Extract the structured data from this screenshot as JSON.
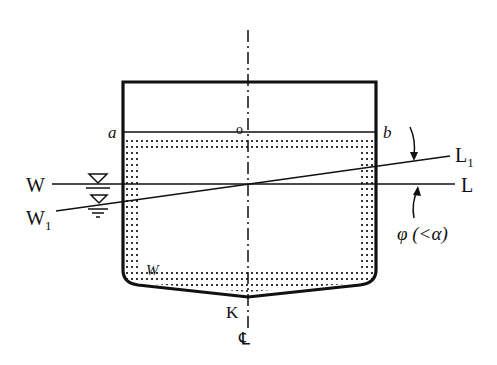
{
  "diagram": {
    "top_cropped_text": "",
    "labels": {
      "a": "a",
      "b": "b",
      "o": "O",
      "W": "W",
      "W1": "W",
      "W1_sub": "1",
      "L": "L",
      "L1": "L",
      "L1_sub": "1",
      "K": "K",
      "CL": "℄",
      "liquid": "W",
      "angle": "φ (<α)"
    },
    "colors": {
      "line": "#111111",
      "dots": "#333333",
      "background": "#ffffff"
    }
  }
}
